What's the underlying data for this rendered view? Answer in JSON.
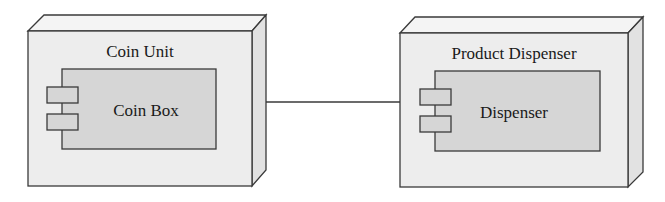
{
  "diagram": {
    "type": "UML deployment diagram",
    "nodes": [
      {
        "id": "coin-unit",
        "label": "Coin Unit",
        "component": {
          "label": "Coin Box"
        }
      },
      {
        "id": "product-dispenser",
        "label": "Product Dispenser",
        "component": {
          "label": "Dispenser"
        }
      }
    ],
    "connections": [
      {
        "from": "coin-unit",
        "to": "product-dispenser"
      }
    ],
    "colors": {
      "node_front": "#ededed",
      "node_top": "#f4f4f4",
      "node_side": "#e2e2e2",
      "component_fill": "#d6d6d6",
      "stroke": "#3a3a3a"
    }
  }
}
